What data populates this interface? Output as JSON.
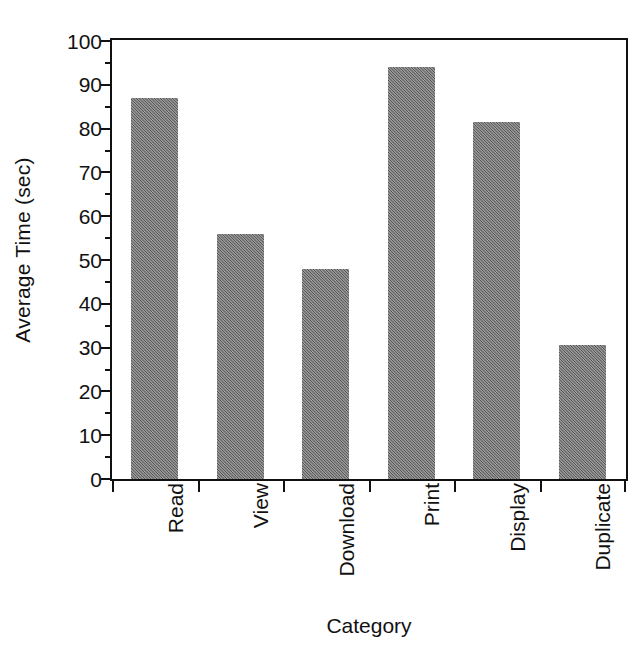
{
  "chart_data": {
    "type": "bar",
    "title": "",
    "subtitle": "",
    "xlabel": "Category",
    "ylabel": "Average Time (sec)",
    "categories": [
      "Read",
      "View",
      "Download",
      "Print",
      "Display",
      "Duplicate"
    ],
    "values": [
      87,
      56,
      48,
      94,
      81.5,
      30.5
    ],
    "ylim": [
      0,
      100
    ],
    "ytick_major": [
      0,
      10,
      20,
      30,
      40,
      50,
      60,
      70,
      80,
      90,
      100
    ],
    "ytick_minor": [
      5,
      15,
      25,
      35,
      45,
      55,
      65,
      75,
      85,
      95
    ],
    "ytick_labels": [
      "0",
      "10",
      "20",
      "30",
      "40",
      "50",
      "60",
      "70",
      "80",
      "90",
      "100"
    ],
    "grid": false,
    "legend": null,
    "legend_position": "none",
    "bar_color": "#6f6f6f",
    "axis_color": "#111111",
    "background_color": "#ffffff",
    "annotations": []
  },
  "axes": {
    "y_title": "Average Time (sec)",
    "x_title": "Category"
  }
}
